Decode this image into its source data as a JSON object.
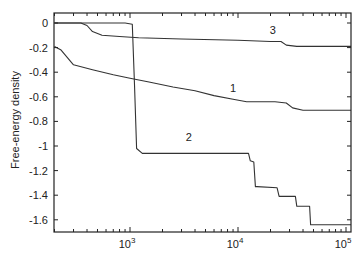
{
  "chart_data": {
    "type": "line",
    "title": "",
    "xlabel": "",
    "ylabel": "Free-energy density",
    "xscale": "log",
    "xlim": [
      200,
      112000
    ],
    "ylim": [
      -1.7,
      0.03
    ],
    "grid": false,
    "legend": "none (curves labeled inline)",
    "x_tick_labels": [
      "10^3",
      "10^4",
      "10^5"
    ],
    "x_ticks": [
      1000,
      10000,
      100000
    ],
    "y_tick_labels": [
      "0",
      "-0.2",
      "-0.4",
      "-0.6",
      "-0.8",
      "-1",
      "-1.2",
      "-1.4",
      "-1.6"
    ],
    "y_ticks": [
      0,
      -0.2,
      -0.4,
      -0.6,
      -0.8,
      -1,
      -1.2,
      -1.4,
      -1.6
    ],
    "series": [
      {
        "name": "1",
        "label_pos": {
          "x": 9000,
          "y": -0.56
        },
        "x": [
          200,
          230,
          300,
          450,
          700,
          1000,
          1500,
          2500,
          4000,
          6000,
          9000,
          12000,
          16000,
          22000,
          28000,
          32000,
          40000,
          60000,
          112000
        ],
        "y": [
          -0.19,
          -0.22,
          -0.34,
          -0.38,
          -0.42,
          -0.45,
          -0.48,
          -0.52,
          -0.55,
          -0.59,
          -0.62,
          -0.64,
          -0.64,
          -0.64,
          -0.65,
          -0.69,
          -0.71,
          -0.71,
          -0.71
        ]
      },
      {
        "name": "2",
        "label_pos": {
          "x": 3500,
          "y": -0.96
        },
        "x": [
          200,
          900,
          1050,
          1100,
          1150,
          1300,
          3000,
          10000,
          12500,
          13000,
          14000,
          14500,
          15000,
          23000,
          24000,
          34000,
          35000,
          46000,
          47000,
          112000
        ],
        "y": [
          0,
          0,
          -0.01,
          -0.5,
          -1.02,
          -1.06,
          -1.06,
          -1.06,
          -1.06,
          -1.12,
          -1.13,
          -1.33,
          -1.33,
          -1.34,
          -1.41,
          -1.41,
          -1.49,
          -1.49,
          -1.64,
          -1.64
        ]
      },
      {
        "name": "3",
        "label_pos": {
          "x": 21000,
          "y": -0.09
        },
        "x": [
          200,
          350,
          400,
          450,
          550,
          800,
          1200,
          3000,
          10000,
          20000,
          25000,
          28000,
          35000,
          50000,
          112000
        ],
        "y": [
          0,
          0,
          -0.02,
          -0.07,
          -0.1,
          -0.11,
          -0.12,
          -0.13,
          -0.14,
          -0.15,
          -0.15,
          -0.18,
          -0.19,
          -0.19,
          -0.19
        ]
      }
    ]
  }
}
